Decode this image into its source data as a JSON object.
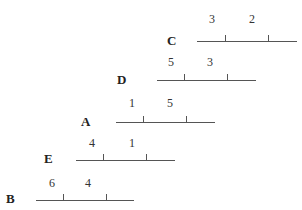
{
  "rows": [
    {
      "label": "C",
      "numbers": [
        "3",
        "2"
      ]
    },
    {
      "label": "D",
      "numbers": [
        "5",
        "3"
      ]
    },
    {
      "label": "A",
      "numbers": [
        "1",
        "5"
      ]
    },
    {
      "label": "E",
      "numbers": [
        "4",
        "1"
      ]
    },
    {
      "label": "B",
      "numbers": [
        "6",
        "4"
      ]
    }
  ]
}
